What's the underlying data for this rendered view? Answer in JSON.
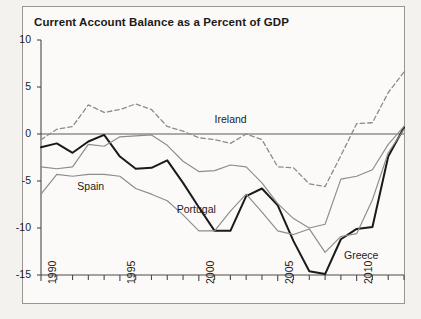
{
  "figure": {
    "title": "Current Account Balance as a Percent of GDP"
  },
  "chart_data": {
    "type": "line",
    "title": "Current Account Balance as a Percent of GDP",
    "xlabel": "",
    "ylabel": "",
    "xlim": [
      1990,
      2013
    ],
    "ylim": [
      -15,
      10
    ],
    "yticks": [
      "10",
      "5",
      "0",
      "-5",
      "-10",
      "-15"
    ],
    "ytick_values": [
      10,
      5,
      0,
      -5,
      -10,
      -15
    ],
    "xticks": [
      "1990",
      "1995",
      "2000",
      "2005",
      "2010"
    ],
    "xtick_values": [
      1990,
      1995,
      2000,
      2005,
      2010
    ],
    "grid": false,
    "legend": "inline-labels",
    "zero_line": true,
    "x": [
      1990,
      1991,
      1992,
      1993,
      1994,
      1995,
      1996,
      1997,
      1998,
      1999,
      2000,
      2001,
      2002,
      2003,
      2004,
      2005,
      2006,
      2007,
      2008,
      2009,
      2010,
      2011,
      2012,
      2013
    ],
    "series": [
      {
        "name": "Ireland",
        "style": "dashed",
        "color": "#8c8c8c",
        "label_x": 2001,
        "label_y": 1.5,
        "values": [
          -0.6,
          0.5,
          0.8,
          3.1,
          2.3,
          2.6,
          3.2,
          2.6,
          0.8,
          0.3,
          -0.4,
          -0.6,
          -1.0,
          0.0,
          -0.6,
          -3.5,
          -3.6,
          -5.3,
          -5.6,
          -2.3,
          1.1,
          1.2,
          4.4,
          6.6
        ]
      },
      {
        "name": "Greece",
        "style": "solid-bold",
        "color": "#1a1a1a",
        "label_x": 2009.2,
        "label_y": -13.0,
        "values": [
          -1.4,
          -1.0,
          -2.0,
          -0.8,
          -0.1,
          -2.4,
          -3.7,
          -3.6,
          -2.8,
          -5.2,
          -7.8,
          -10.3,
          -10.3,
          -6.6,
          -5.8,
          -7.6,
          -11.4,
          -14.6,
          -14.9,
          -11.2,
          -10.1,
          -9.9,
          -2.4,
          0.7
        ]
      },
      {
        "name": "Portugal",
        "style": "solid",
        "color": "#8c8c8c",
        "label_x": 1998.6,
        "label_y": -8.1,
        "values": [
          -6.4,
          -4.3,
          -4.5,
          -4.3,
          -4.3,
          -4.5,
          -5.8,
          -6.4,
          -7.1,
          -8.6,
          -10.3,
          -10.3,
          -8.2,
          -6.4,
          -8.3,
          -10.3,
          -10.7,
          -10.1,
          -12.6,
          -10.9,
          -10.6,
          -7.0,
          -2.0,
          0.5
        ]
      },
      {
        "name": "Spain",
        "style": "solid",
        "color": "#8c8c8c",
        "label_x": 1992.3,
        "label_y": -5.6,
        "values": [
          -3.5,
          -3.7,
          -3.5,
          -1.1,
          -1.3,
          -0.3,
          -0.2,
          -0.1,
          -1.2,
          -2.9,
          -4.0,
          -3.9,
          -3.3,
          -3.5,
          -5.2,
          -7.4,
          -9.0,
          -10.0,
          -9.6,
          -4.8,
          -4.5,
          -3.8,
          -1.1,
          0.8
        ]
      }
    ]
  },
  "axes": {
    "y_labels": [
      "10",
      "5",
      "0",
      "-5",
      "-10",
      "-15"
    ],
    "x_labels": [
      "1990",
      "1995",
      "2000",
      "2005",
      "2010"
    ]
  },
  "series_labels": {
    "ireland": "Ireland",
    "greece": "Greece",
    "portugal": "Portugal",
    "spain": "Spain"
  }
}
